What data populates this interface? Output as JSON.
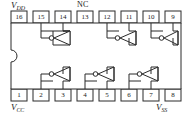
{
  "diagram": {
    "type": "ic-pinout",
    "package": {
      "pin_count": 16,
      "notch": "left-edge-semicircle"
    },
    "rail_labels": [
      {
        "id": "vdd",
        "text": "V",
        "sub": "DD",
        "position": "top-left",
        "near_pin": "16"
      },
      {
        "id": "nc",
        "text": "NC",
        "sub": "",
        "position": "top-center",
        "near_pin": "13"
      },
      {
        "id": "vcc",
        "text": "V",
        "sub": "CC",
        "position": "bottom-left",
        "near_pin": "1"
      },
      {
        "id": "vss",
        "text": "V",
        "sub": "SS",
        "position": "bottom-right",
        "near_pin": "8"
      }
    ],
    "pins_top": [
      {
        "number": "16"
      },
      {
        "number": "15"
      },
      {
        "number": "14"
      },
      {
        "number": "13"
      },
      {
        "number": "12"
      },
      {
        "number": "11"
      },
      {
        "number": "10"
      },
      {
        "number": "9"
      }
    ],
    "pins_bottom": [
      {
        "number": "1"
      },
      {
        "number": "2"
      },
      {
        "number": "3"
      },
      {
        "number": "4"
      },
      {
        "number": "5"
      },
      {
        "number": "6"
      },
      {
        "number": "7"
      },
      {
        "number": "8"
      }
    ],
    "gates": [
      {
        "id": "gate-1",
        "symbol": "inverter",
        "orientation": "points-left",
        "row": "top",
        "input_pin": "14",
        "output_pin": "15"
      },
      {
        "id": "gate-2",
        "symbol": "inverter",
        "orientation": "points-left",
        "row": "top",
        "input_pin": "11",
        "output_pin": "12"
      },
      {
        "id": "gate-3",
        "symbol": "inverter",
        "orientation": "points-left",
        "row": "top",
        "input_pin": "9",
        "output_pin": "10"
      },
      {
        "id": "gate-4",
        "symbol": "inverter",
        "orientation": "points-left",
        "row": "bottom",
        "input_pin": "3",
        "output_pin": "2"
      },
      {
        "id": "gate-5",
        "symbol": "inverter",
        "orientation": "points-left",
        "row": "bottom",
        "input_pin": "5",
        "output_pin": "4"
      },
      {
        "id": "gate-6",
        "symbol": "inverter",
        "orientation": "points-left",
        "row": "bottom",
        "input_pin": "7",
        "output_pin": "6"
      }
    ],
    "colors": {
      "line": "#2b2b2b",
      "body_fill": "#ffffff",
      "text": "#1a1a1a",
      "background": "#ffffff"
    }
  }
}
